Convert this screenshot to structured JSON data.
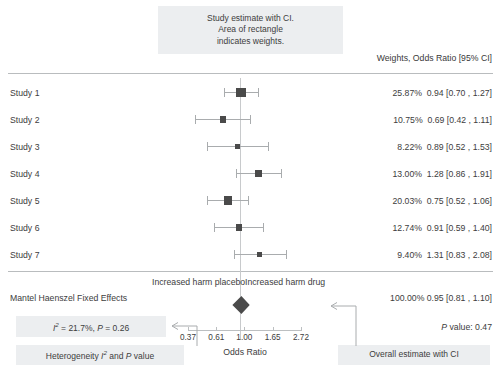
{
  "annotations": {
    "study_estimate_callout": [
      "Study estimate with CI.",
      "Area of rectangle",
      "indicates weights."
    ],
    "heterogeneity_box": "I² = 21.7%, P = 0.26",
    "heterogeneity_label": "Heterogeneity I² and P value",
    "overall_label": "Overall estimate with CI",
    "harm_left": "Increased harm placebo",
    "harm_right": "Increased harm drug"
  },
  "table": {
    "column_header": "Weights, Odds Ratio [95% CI]",
    "rows": [
      {
        "study": "Study 1",
        "weight": "25.87%",
        "estimate": "0.94 [0.70 , 1.27]"
      },
      {
        "study": "Study 2",
        "weight": "10.75%",
        "estimate": "0.69 [0.42 , 1.11]"
      },
      {
        "study": "Study 3",
        "weight": "8.22%",
        "estimate": "0.89 [0.52 , 1.53]"
      },
      {
        "study": "Study 4",
        "weight": "13.00%",
        "estimate": "1.28 [0.86 , 1.91]"
      },
      {
        "study": "Study 5",
        "weight": "20.03%",
        "estimate": "0.75 [0.52 , 1.06]"
      },
      {
        "study": "Study 6",
        "weight": "12.74%",
        "estimate": "0.91 [0.59 , 1.40]"
      },
      {
        "study": "Study 7",
        "weight": "9.40%",
        "estimate": "1.31 [0.83 , 2.08]"
      }
    ]
  },
  "summary": {
    "model_label": "Mantel Haenszel Fixed Effects",
    "overall_stats": "100.00% 0.95 [0.81 , 1.10]",
    "p_value_text": "P value: 0.47"
  },
  "axis": {
    "title": "Odds Ratio",
    "ticks": [
      "0.37",
      "0.61",
      "1.00",
      "1.65",
      "2.72"
    ]
  },
  "colors": {
    "marker": "#4a4a4a",
    "ci_line": "#a9acae",
    "callout_bg": "#eceef0",
    "rule": "#b9bcbe",
    "text": "#3d3d3d"
  },
  "chart_data": {
    "type": "forest",
    "title": "",
    "xlabel": "Odds Ratio",
    "ylabel": "",
    "xscale": "log",
    "xlim": [
      0.37,
      2.72
    ],
    "xticks": [
      0.37,
      0.61,
      1.0,
      1.65,
      2.72
    ],
    "reference_line": 1.0,
    "effect_measure": "Odds Ratio",
    "model": "Mantel Haenszel Fixed Effects",
    "heterogeneity": {
      "I2_percent": 21.7,
      "p": 0.26
    },
    "overall_p_value": 0.47,
    "studies": [
      {
        "label": "Study 1",
        "estimate": 0.94,
        "lower": 0.7,
        "upper": 1.27,
        "weight": 25.87
      },
      {
        "label": "Study 2",
        "estimate": 0.69,
        "lower": 0.42,
        "upper": 1.11,
        "weight": 10.75
      },
      {
        "label": "Study 3",
        "estimate": 0.89,
        "lower": 0.52,
        "upper": 1.53,
        "weight": 8.22
      },
      {
        "label": "Study 4",
        "estimate": 1.28,
        "lower": 0.86,
        "upper": 1.91,
        "weight": 13.0
      },
      {
        "label": "Study 5",
        "estimate": 0.75,
        "lower": 0.52,
        "upper": 1.06,
        "weight": 20.03
      },
      {
        "label": "Study 6",
        "estimate": 0.91,
        "lower": 0.59,
        "upper": 1.4,
        "weight": 12.74
      },
      {
        "label": "Study 7",
        "estimate": 1.31,
        "lower": 0.83,
        "upper": 2.08,
        "weight": 9.4
      }
    ],
    "overall": {
      "label": "Overall",
      "estimate": 0.95,
      "lower": 0.81,
      "upper": 1.1,
      "weight": 100.0
    }
  }
}
